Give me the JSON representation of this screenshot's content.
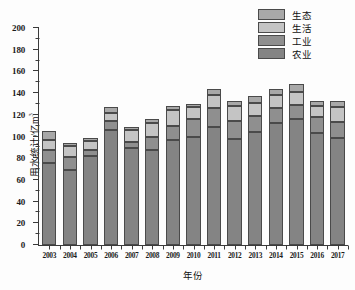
{
  "chart_data": {
    "type": "bar",
    "stacked": true,
    "title": "",
    "xlabel": "年份",
    "ylabel": "用水统计/亿m³",
    "ylim": [
      0,
      200
    ],
    "ytick_step": 20,
    "yticks": [
      0,
      20,
      40,
      60,
      80,
      100,
      120,
      140,
      160,
      180,
      200
    ],
    "ytick_labels": [
      "0",
      "20",
      "40",
      "60",
      "80",
      "100",
      "120",
      "140",
      "160",
      "180",
      "200"
    ],
    "minor_ticks": true,
    "grid": false,
    "legend_position": "top-right",
    "categories": [
      "2003",
      "2004",
      "2005",
      "2006",
      "2007",
      "2008",
      "2009",
      "2010",
      "2011",
      "2012",
      "2013",
      "2014",
      "2015",
      "2016",
      "2017"
    ],
    "series": [
      {
        "name": "农业",
        "color": "#848484",
        "values": [
          76,
          69,
          82,
          106,
          89,
          88,
          97,
          100,
          109,
          98,
          104,
          112,
          116,
          103,
          99
        ]
      },
      {
        "name": "工业",
        "color": "#8f8f8f",
        "values": [
          12,
          12,
          6,
          8,
          6,
          12,
          13,
          16,
          17,
          16,
          15,
          14,
          13,
          15,
          14
        ]
      },
      {
        "name": "生活",
        "color": "#c4c4c4",
        "values": [
          9,
          10,
          8,
          8,
          11,
          12,
          14,
          11,
          12,
          14,
          12,
          12,
          12,
          10,
          14
        ]
      },
      {
        "name": "生态",
        "color": "#a8a8a8",
        "values": [
          8,
          3,
          3,
          5,
          3,
          4,
          4,
          3,
          6,
          5,
          6,
          6,
          7,
          5,
          6
        ]
      }
    ],
    "totals": [
      105,
      94,
      99,
      127,
      109,
      116,
      128,
      130,
      144,
      133,
      137,
      144,
      148,
      133,
      133
    ]
  },
  "legend": {
    "entries": [
      {
        "label": "生态",
        "color": "#a8a8a8"
      },
      {
        "label": "生活",
        "color": "#c4c4c4"
      },
      {
        "label": "工业",
        "color": "#8f8f8f"
      },
      {
        "label": "农业",
        "color": "#848484"
      }
    ]
  },
  "axes": {
    "y_title": "用水统计/亿m",
    "y_title_sup": "3",
    "x_title": "年份"
  }
}
